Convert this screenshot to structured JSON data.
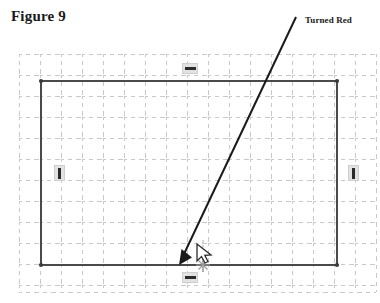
{
  "figure": {
    "title": "Figure 9",
    "callout_label": "Turned Red"
  },
  "colors": {
    "background": "#ffffff",
    "grid_line": "#c9c9c9",
    "sketch_line": "#4a4a4a",
    "sketch_line_dark": "#3a3a3a",
    "leader_arrow": "#1a1a1a",
    "badge_fill": "#e2e2e2",
    "badge_border": "#cfcfcf",
    "badge_glyph": "#2b2b2b",
    "text": "#1a1a1a",
    "cursor_fill": "#ffffff",
    "cursor_stroke": "#2b2b2b",
    "snap_marker": "#9a9a9a"
  },
  "grid": {
    "visible": true,
    "style": "dashed",
    "spacing_px": 21,
    "origin_x": 19,
    "origin_y": 54,
    "columns": 17,
    "rows": 11,
    "extent_x": 376,
    "extent_y": 292
  },
  "sketch": {
    "shape": "rectangle",
    "x": 41,
    "y": 81,
    "width": 296,
    "height": 184,
    "stroke_width": 2,
    "corner_markers": [
      {
        "name": "top-left",
        "x": 41,
        "y": 81
      },
      {
        "name": "top-right",
        "x": 337,
        "y": 81
      },
      {
        "name": "bottom-left",
        "x": 41,
        "y": 265
      },
      {
        "name": "bottom-right",
        "x": 337,
        "y": 265
      }
    ]
  },
  "leader": {
    "type": "arrow",
    "start_x": 296,
    "start_y": 17,
    "end_x": 179,
    "end_y": 264,
    "stroke_width": 2,
    "arrowhead": "filled-triangle"
  },
  "constraints": [
    {
      "name": "horizontal-top",
      "glyph": "horizontal-constraint-icon",
      "x": 182,
      "y": 63
    },
    {
      "name": "horizontal-bottom",
      "glyph": "horizontal-constraint-icon",
      "x": 182,
      "y": 272
    },
    {
      "name": "vertical-left",
      "glyph": "vertical-constraint-icon",
      "x": 54,
      "y": 165
    },
    {
      "name": "vertical-right",
      "glyph": "vertical-constraint-icon",
      "x": 348,
      "y": 165
    }
  ],
  "cursor": {
    "name": "mouse-pointer",
    "x": 200,
    "y": 245,
    "snap_marker_x": 202,
    "snap_marker_y": 265
  }
}
